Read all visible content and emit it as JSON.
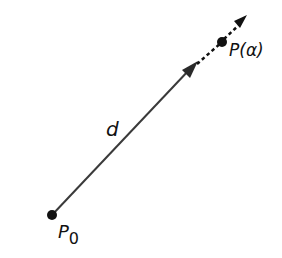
{
  "diagram": {
    "labels": {
      "start_point": "P",
      "start_subscript": "0",
      "direction": "d",
      "end_point": "P(α)"
    },
    "colors": {
      "line": "#3a3a3a",
      "point": "#111111",
      "background": "#ffffff"
    },
    "points": {
      "p0": [
        52,
        215
      ],
      "arrowhead_mid": [
        193,
        66
      ],
      "p_alpha": [
        222,
        42
      ],
      "arrow_tip": [
        247,
        16
      ]
    }
  }
}
